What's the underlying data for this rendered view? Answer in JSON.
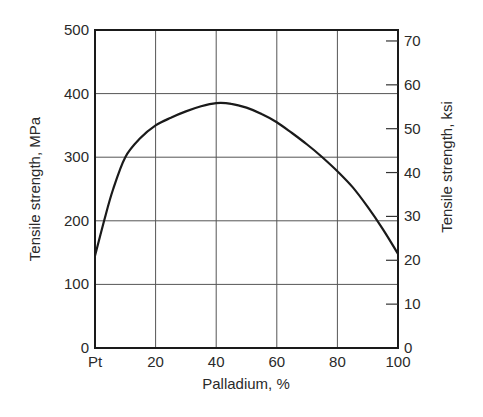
{
  "chart_data": {
    "type": "line",
    "title": "",
    "xlabel": "Palladium, %",
    "ylabel": "Tensile strength, MPa",
    "ylabel_right": "Tensile strength, ksi",
    "xlim": [
      0,
      100
    ],
    "ylim": [
      0,
      500
    ],
    "ylim_right": [
      0,
      72.5
    ],
    "grid": true,
    "x_tick_labels": [
      "Pt",
      "20",
      "40",
      "60",
      "80",
      "100"
    ],
    "x_ticks": [
      0,
      20,
      40,
      60,
      80,
      100
    ],
    "y_tick_labels": [
      "0",
      "100",
      "200",
      "300",
      "400",
      "500"
    ],
    "y_ticks": [
      0,
      100,
      200,
      300,
      400,
      500
    ],
    "y_right_tick_labels": [
      "0",
      "10",
      "20",
      "30",
      "40",
      "50",
      "60",
      "70"
    ],
    "y_right_ticks": [
      0,
      10,
      20,
      30,
      40,
      50,
      60,
      70
    ],
    "series": [
      {
        "name": "Pt-Pd tensile strength",
        "x": [
          0,
          3,
          6,
          10,
          15,
          20,
          25,
          30,
          35,
          40,
          45,
          50,
          55,
          60,
          65,
          70,
          75,
          80,
          85,
          90,
          95,
          100
        ],
        "values": [
          145,
          200,
          250,
          300,
          330,
          350,
          362,
          372,
          380,
          385,
          384,
          378,
          368,
          355,
          338,
          320,
          300,
          278,
          253,
          222,
          187,
          148
        ]
      }
    ]
  }
}
